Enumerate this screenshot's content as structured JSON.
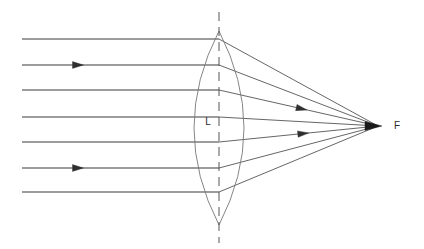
{
  "diagram": {
    "type": "optics-ray-diagram",
    "background_color": "#ffffff",
    "labels": {
      "lens": "L",
      "focal_point": "F"
    },
    "colors": {
      "incident_ray": "#3a3a3a",
      "refracted_ray": "#4a4a4a",
      "lens_outline": "#777777",
      "optical_axis": "#555555",
      "arrow": "#2f2f2f",
      "label_text": "#2b2b2b"
    },
    "lens": {
      "name": "biconvex-converging-lens",
      "center_x": 219,
      "top_vertex_y": 31,
      "bottom_vertex_y": 225,
      "half_width": 25
    },
    "optical_axis": {
      "name": "principal-axis",
      "x": 219,
      "y_top": 12,
      "y_bottom": 243,
      "style": "dashed"
    },
    "focal_point": {
      "x": 378,
      "y": 126,
      "label_x": 397,
      "label_y": 126
    },
    "lens_label_position": {
      "x": 208,
      "y": 122
    },
    "incident_rays": [
      {
        "y": 39,
        "x_start": 22,
        "x_end": 219,
        "arrow_at_x": null
      },
      {
        "y": 65,
        "x_start": 22,
        "x_end": 219,
        "arrow_at_x": 78
      },
      {
        "y": 90,
        "x_start": 22,
        "x_end": 219,
        "arrow_at_x": null
      },
      {
        "y": 117,
        "x_start": 22,
        "x_end": 219,
        "arrow_at_x": null
      },
      {
        "y": 142,
        "x_start": 22,
        "x_end": 219,
        "arrow_at_x": null
      },
      {
        "y": 168,
        "x_start": 22,
        "x_end": 219,
        "arrow_at_x": 78
      },
      {
        "y": 192,
        "x_start": 22,
        "x_end": 219,
        "arrow_at_x": null
      }
    ],
    "refracted_rays": [
      {
        "from_x": 219,
        "from_y": 39,
        "to_x": 378,
        "to_y": 126,
        "arrow_at_t": null
      },
      {
        "from_x": 219,
        "from_y": 65,
        "to_x": 378,
        "to_y": 126,
        "arrow_at_t": null
      },
      {
        "from_x": 219,
        "from_y": 90,
        "to_x": 378,
        "to_y": 126,
        "arrow_at_t": 0.52
      },
      {
        "from_x": 219,
        "from_y": 117,
        "to_x": 378,
        "to_y": 126,
        "arrow_at_t": null
      },
      {
        "from_x": 219,
        "from_y": 142,
        "to_x": 378,
        "to_y": 126,
        "arrow_at_t": 0.53
      },
      {
        "from_x": 219,
        "from_y": 168,
        "to_x": 378,
        "to_y": 126,
        "arrow_at_t": null
      },
      {
        "from_x": 219,
        "from_y": 192,
        "to_x": 378,
        "to_y": 126,
        "arrow_at_t": null
      }
    ]
  }
}
